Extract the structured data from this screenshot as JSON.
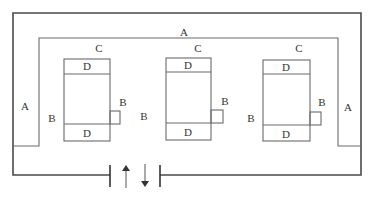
{
  "colors": {
    "outer_line": "#4a4a4a",
    "inner_line": "#6a6a6a",
    "text": "#333333"
  },
  "labels": {
    "top_a": "A",
    "left_a": "A",
    "right_a": "A",
    "left_b": "B",
    "mid_b1": "B",
    "mid_b2": "B",
    "units": [
      {
        "c": "C",
        "d_top": "D",
        "d_bottom": "D",
        "b": "B"
      },
      {
        "c": "C",
        "d_top": "D",
        "d_bottom": "D",
        "b": "B"
      },
      {
        "c": "C",
        "d_top": "D",
        "d_bottom": "D",
        "b": "B"
      }
    ]
  },
  "arrows": [
    {
      "name": "up-arrow",
      "direction": "up"
    },
    {
      "name": "down-arrow",
      "direction": "down"
    }
  ]
}
